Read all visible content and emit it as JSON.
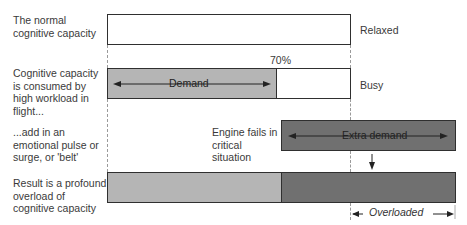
{
  "rows": [
    {
      "description": "The normal cognitive capacity",
      "state": "Relaxed"
    },
    {
      "description": "Cognitive capacity is consumed by high workload in flight...",
      "state": "Busy",
      "bar_label": "Demand",
      "percent_label": "70%"
    },
    {
      "description": "...add in an emotional pulse or surge, or 'belt'",
      "event_label": "Engine fails in critical situation",
      "bar_label": "Extra demand"
    },
    {
      "description": "Result is a profound overload of cognitive capacity",
      "bracket_label": "Overloaded"
    }
  ],
  "colors": {
    "outline": "#2f2f2f",
    "demand_fill": "#b5b5b5",
    "extra_demand_fill": "#707070",
    "capacity_fill": "#ffffff",
    "dash_line": "#9a9a9a"
  }
}
